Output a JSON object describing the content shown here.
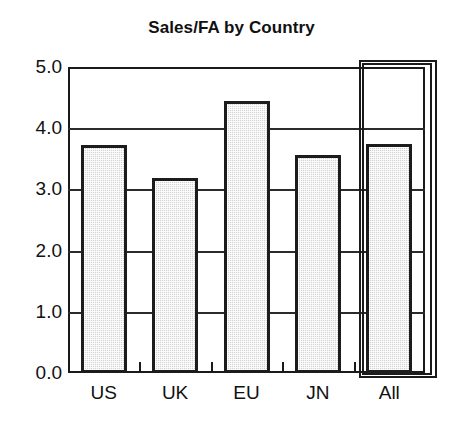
{
  "chart_data": {
    "type": "bar",
    "title": "Sales/FA by Country",
    "xlabel": "",
    "ylabel": "",
    "categories": [
      "US",
      "UK",
      "EU",
      "JN",
      "All"
    ],
    "values": [
      3.72,
      3.19,
      4.45,
      3.56,
      3.74
    ],
    "ylim": [
      0.0,
      5.0
    ],
    "ytick_labels": [
      "0.0",
      "1.0",
      "2.0",
      "3.0",
      "4.0",
      "5.0"
    ],
    "ytick_values": [
      0.0,
      1.0,
      2.0,
      3.0,
      4.0,
      5.0
    ],
    "grid": "horizontal",
    "legend": "none",
    "bar_fill_color": "#d2d2d2",
    "bar_edge_color": "#1c1c1c",
    "axis_color": "#1a1a1a",
    "background_color": "#ffffff",
    "highlight_category": "All",
    "annotations": [
      "double rectangle outline drawn around the 'All' category bar"
    ]
  }
}
